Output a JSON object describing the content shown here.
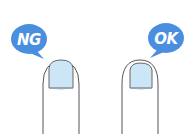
{
  "illustration": {
    "left": {
      "label": "NG",
      "meaning": "bad nail length - nail extends beyond fingertip"
    },
    "right": {
      "label": "OK",
      "meaning": "good nail length - nail trimmed short"
    }
  },
  "colors": {
    "bubble": "#4a8ee0",
    "bubble_text": "#ffffff",
    "nail_fill": "#cde6f7",
    "outline": "#555555",
    "background": "#ffffff"
  }
}
